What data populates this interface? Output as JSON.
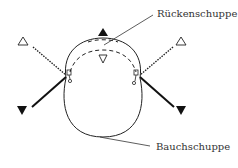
{
  "diagram": {
    "labels": {
      "dorsal_scale": "Rückenschuppe",
      "ventral_scale": "Bauchschuppe"
    },
    "markers": {
      "top_filled": "filled-triangle-up",
      "top_open": "open-triangle-down",
      "left_open": "open-triangle-up",
      "left_filled": "filled-triangle-down",
      "right_open": "open-triangle-up",
      "right_filled": "filled-triangle-down"
    },
    "colors": {
      "stroke": "#222222",
      "background": "#ffffff"
    }
  }
}
